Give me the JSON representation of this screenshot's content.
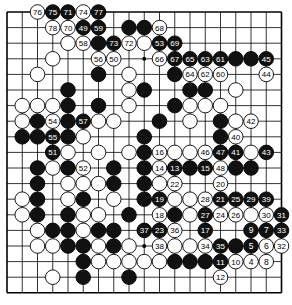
{
  "board": {
    "size": 19,
    "origin_x": 7,
    "origin_y": 12,
    "step_x": 15.25,
    "step_y": 15.6,
    "stone_radius": 7.3,
    "colors": {
      "black": "#111111",
      "white": "#ffffff",
      "line": "#000000",
      "label_on_black": "#ffffff",
      "label_on_white": "#000000"
    },
    "hoshi": [
      [
        3,
        3
      ],
      [
        9,
        3
      ],
      [
        15,
        3
      ],
      [
        3,
        9
      ],
      [
        9,
        9
      ],
      [
        15,
        9
      ],
      [
        3,
        15
      ],
      [
        9,
        15
      ],
      [
        15,
        15
      ]
    ]
  },
  "stones": [
    [
      "W",
      2,
      0,
      "76"
    ],
    [
      "B",
      3,
      0,
      "75"
    ],
    [
      "B",
      4,
      0,
      "71"
    ],
    [
      "W",
      5,
      0,
      "74"
    ],
    [
      "B",
      6,
      0,
      "77"
    ],
    [
      "W",
      3,
      1,
      "78"
    ],
    [
      "W",
      4,
      1,
      "70"
    ],
    [
      "B",
      5,
      1,
      "49"
    ],
    [
      "B",
      6,
      1,
      "59"
    ],
    [
      "B",
      8,
      1,
      ""
    ],
    [
      "B",
      9,
      1,
      ""
    ],
    [
      "W",
      10,
      1,
      "68"
    ],
    [
      "W",
      4,
      2,
      ""
    ],
    [
      "W",
      5,
      2,
      "58"
    ],
    [
      "B",
      6,
      2,
      ""
    ],
    [
      "B",
      7,
      2,
      "73"
    ],
    [
      "W",
      8,
      2,
      "72"
    ],
    [
      "W",
      9,
      2,
      ""
    ],
    [
      "B",
      10,
      2,
      "53"
    ],
    [
      "B",
      11,
      2,
      "69"
    ],
    [
      "W",
      3,
      3,
      ""
    ],
    [
      "W",
      6,
      3,
      "56"
    ],
    [
      "W",
      7,
      3,
      "50"
    ],
    [
      "W",
      10,
      3,
      "66"
    ],
    [
      "B",
      11,
      3,
      "67"
    ],
    [
      "B",
      12,
      3,
      "65"
    ],
    [
      "B",
      13,
      3,
      "63"
    ],
    [
      "B",
      14,
      3,
      "61"
    ],
    [
      "B",
      15,
      3,
      ""
    ],
    [
      "B",
      16,
      3,
      ""
    ],
    [
      "B",
      17,
      3,
      "45"
    ],
    [
      "W",
      2,
      4,
      ""
    ],
    [
      "B",
      6,
      4,
      ""
    ],
    [
      "W",
      8,
      4,
      ""
    ],
    [
      "B",
      11,
      4,
      ""
    ],
    [
      "W",
      12,
      4,
      "64"
    ],
    [
      "W",
      13,
      4,
      "62"
    ],
    [
      "W",
      14,
      4,
      "60"
    ],
    [
      "W",
      17,
      4,
      "44"
    ],
    [
      "B",
      4,
      5,
      ""
    ],
    [
      "W",
      8,
      5,
      ""
    ],
    [
      "B",
      9,
      5,
      ""
    ],
    [
      "B",
      12,
      5,
      ""
    ],
    [
      "B",
      13,
      5,
      ""
    ],
    [
      "W",
      15,
      5,
      ""
    ],
    [
      "W",
      1,
      6,
      ""
    ],
    [
      "W",
      2,
      6,
      ""
    ],
    [
      "W",
      3,
      6,
      ""
    ],
    [
      "B",
      4,
      6,
      ""
    ],
    [
      "B",
      6,
      6,
      ""
    ],
    [
      "W",
      8,
      6,
      ""
    ],
    [
      "B",
      11,
      6,
      ""
    ],
    [
      "W",
      12,
      6,
      ""
    ],
    [
      "W",
      13,
      6,
      ""
    ],
    [
      "W",
      14,
      6,
      ""
    ],
    [
      "W",
      1,
      7,
      ""
    ],
    [
      "B",
      2,
      7,
      ""
    ],
    [
      "W",
      3,
      7,
      "54"
    ],
    [
      "B",
      4,
      7,
      ""
    ],
    [
      "B",
      5,
      7,
      "57"
    ],
    [
      "W",
      6,
      7,
      ""
    ],
    [
      "W",
      7,
      7,
      ""
    ],
    [
      "B",
      10,
      7,
      ""
    ],
    [
      "W",
      12,
      7,
      ""
    ],
    [
      "B",
      14,
      7,
      ""
    ],
    [
      "W",
      15,
      7,
      ""
    ],
    [
      "W",
      16,
      7,
      "42"
    ],
    [
      "B",
      1,
      8,
      ""
    ],
    [
      "B",
      2,
      8,
      ""
    ],
    [
      "B",
      3,
      8,
      "55"
    ],
    [
      "B",
      4,
      8,
      ""
    ],
    [
      "W",
      5,
      8,
      ""
    ],
    [
      "B",
      9,
      8,
      ""
    ],
    [
      "B",
      14,
      8,
      ""
    ],
    [
      "W",
      15,
      8,
      "40"
    ],
    [
      "B",
      3,
      9,
      "51"
    ],
    [
      "W",
      4,
      9,
      ""
    ],
    [
      "W",
      6,
      9,
      ""
    ],
    [
      "W",
      8,
      9,
      ""
    ],
    [
      "B",
      9,
      9,
      ""
    ],
    [
      "W",
      10,
      9,
      "16"
    ],
    [
      "W",
      11,
      9,
      ""
    ],
    [
      "W",
      12,
      9,
      ""
    ],
    [
      "W",
      13,
      9,
      "46"
    ],
    [
      "B",
      14,
      9,
      "47"
    ],
    [
      "B",
      15,
      9,
      "41"
    ],
    [
      "W",
      16,
      9,
      ""
    ],
    [
      "B",
      17,
      9,
      "43"
    ],
    [
      "B",
      2,
      10,
      ""
    ],
    [
      "W",
      3,
      10,
      ""
    ],
    [
      "B",
      4,
      10,
      ""
    ],
    [
      "W",
      5,
      10,
      "52"
    ],
    [
      "B",
      7,
      10,
      ""
    ],
    [
      "B",
      9,
      10,
      ""
    ],
    [
      "W",
      10,
      10,
      "14"
    ],
    [
      "B",
      11,
      10,
      "13"
    ],
    [
      "B",
      12,
      10,
      ""
    ],
    [
      "B",
      13,
      10,
      "15"
    ],
    [
      "W",
      14,
      10,
      "48"
    ],
    [
      "B",
      15,
      10,
      ""
    ],
    [
      "B",
      16,
      10,
      ""
    ],
    [
      "B",
      2,
      11,
      ""
    ],
    [
      "W",
      4,
      11,
      ""
    ],
    [
      "W",
      5,
      11,
      ""
    ],
    [
      "W",
      6,
      11,
      ""
    ],
    [
      "B",
      7,
      11,
      ""
    ],
    [
      "B",
      9,
      11,
      ""
    ],
    [
      "W",
      10,
      11,
      ""
    ],
    [
      "W",
      11,
      11,
      "22"
    ],
    [
      "W",
      14,
      11,
      "20"
    ],
    [
      "W",
      1,
      12,
      ""
    ],
    [
      "B",
      2,
      12,
      ""
    ],
    [
      "W",
      4,
      12,
      ""
    ],
    [
      "B",
      5,
      12,
      ""
    ],
    [
      "W",
      7,
      12,
      ""
    ],
    [
      "B",
      9,
      12,
      ""
    ],
    [
      "B",
      10,
      12,
      "19"
    ],
    [
      "W",
      11,
      12,
      ""
    ],
    [
      "W",
      12,
      12,
      ""
    ],
    [
      "W",
      13,
      12,
      "28"
    ],
    [
      "B",
      14,
      12,
      "21"
    ],
    [
      "B",
      15,
      12,
      "25"
    ],
    [
      "B",
      16,
      12,
      "29"
    ],
    [
      "B",
      17,
      12,
      "39"
    ],
    [
      "W",
      1,
      13,
      ""
    ],
    [
      "B",
      2,
      13,
      ""
    ],
    [
      "B",
      4,
      13,
      ""
    ],
    [
      "W",
      5,
      13,
      ""
    ],
    [
      "W",
      6,
      13,
      ""
    ],
    [
      "B",
      8,
      13,
      ""
    ],
    [
      "W",
      10,
      13,
      "18"
    ],
    [
      "B",
      11,
      13,
      ""
    ],
    [
      "W",
      12,
      13,
      ""
    ],
    [
      "B",
      13,
      13,
      "27"
    ],
    [
      "W",
      14,
      13,
      "24"
    ],
    [
      "W",
      15,
      13,
      "26"
    ],
    [
      "W",
      16,
      13,
      ""
    ],
    [
      "W",
      17,
      13,
      "30"
    ],
    [
      "B",
      18,
      13,
      "31"
    ],
    [
      "W",
      2,
      14,
      ""
    ],
    [
      "B",
      3,
      14,
      ""
    ],
    [
      "B",
      4,
      14,
      ""
    ],
    [
      "W",
      5,
      14,
      ""
    ],
    [
      "B",
      6,
      14,
      ""
    ],
    [
      "B",
      7,
      14,
      ""
    ],
    [
      "B",
      9,
      14,
      "37"
    ],
    [
      "B",
      10,
      14,
      "23"
    ],
    [
      "W",
      11,
      14,
      "36"
    ],
    [
      "B",
      13,
      14,
      "17"
    ],
    [
      "B",
      16,
      14,
      "9"
    ],
    [
      "B",
      17,
      14,
      "7"
    ],
    [
      "B",
      18,
      14,
      "33"
    ],
    [
      "W",
      2,
      15,
      ""
    ],
    [
      "W",
      3,
      15,
      ""
    ],
    [
      "B",
      4,
      15,
      ""
    ],
    [
      "B",
      5,
      15,
      ""
    ],
    [
      "W",
      6,
      15,
      ""
    ],
    [
      "B",
      7,
      15,
      ""
    ],
    [
      "W",
      8,
      15,
      ""
    ],
    [
      "W",
      10,
      15,
      "38"
    ],
    [
      "W",
      11,
      15,
      ""
    ],
    [
      "W",
      12,
      15,
      ""
    ],
    [
      "W",
      13,
      15,
      "34"
    ],
    [
      "B",
      14,
      15,
      "35"
    ],
    [
      "B",
      15,
      15,
      ""
    ],
    [
      "B",
      16,
      15,
      "5"
    ],
    [
      "W",
      17,
      15,
      "6"
    ],
    [
      "W",
      18,
      15,
      "32"
    ],
    [
      "B",
      5,
      16,
      ""
    ],
    [
      "W",
      6,
      16,
      ""
    ],
    [
      "W",
      7,
      16,
      ""
    ],
    [
      "W",
      8,
      16,
      ""
    ],
    [
      "W",
      9,
      16,
      ""
    ],
    [
      "W",
      10,
      16,
      ""
    ],
    [
      "B",
      11,
      16,
      ""
    ],
    [
      "B",
      12,
      16,
      ""
    ],
    [
      "B",
      13,
      16,
      ""
    ],
    [
      "B",
      14,
      16,
      "11"
    ],
    [
      "W",
      15,
      16,
      "10"
    ],
    [
      "W",
      16,
      16,
      "4"
    ],
    [
      "W",
      17,
      16,
      "8"
    ],
    [
      "W",
      3,
      17,
      ""
    ],
    [
      "B",
      5,
      17,
      ""
    ],
    [
      "B",
      8,
      17,
      ""
    ],
    [
      "W",
      14,
      17,
      "12"
    ]
  ]
}
